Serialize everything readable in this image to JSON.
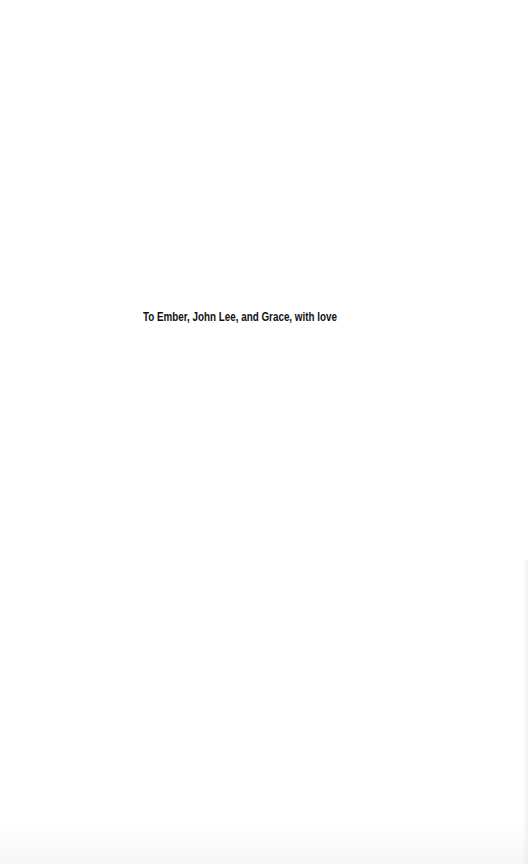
{
  "page": {
    "type": "dedication",
    "background_color": "#ffffff",
    "text_color": "#111111"
  },
  "dedication": {
    "text": "To Ember, John Lee, and Grace, with love"
  }
}
